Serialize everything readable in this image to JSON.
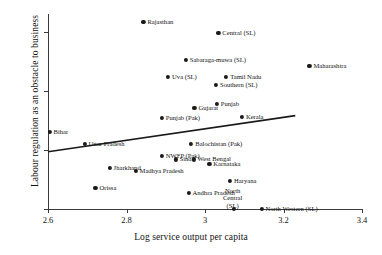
{
  "chart_data": {
    "type": "scatter",
    "title": "",
    "xlabel": "Log service output per capita",
    "ylabel": "Labour regulation as an obstacle to business",
    "xlim": [
      2.6,
      3.4
    ],
    "ylim": [
      0,
      0.33
    ],
    "xticks": [
      2.6,
      2.8,
      3.0,
      3.2,
      3.4
    ],
    "xtick_labels": [
      "2.6",
      "2.8",
      "3",
      "3.2",
      "3.4"
    ],
    "yticks": [
      0,
      0.1,
      0.2,
      0.3
    ],
    "ytick_labels": [
      "0",
      ".1",
      ".2",
      ".3"
    ],
    "grid": false,
    "legend": "none",
    "marker_color": "#1a1a1a",
    "line_color": "#1a1a1a",
    "fit_line": {
      "label": "linear fit",
      "x0": 2.6,
      "y0": 0.097,
      "x1": 3.23,
      "y1": 0.158
    },
    "points": [
      {
        "label": "Rajasthan",
        "x": 2.843,
        "y": 0.316,
        "lpos": "r"
      },
      {
        "label": "Central (SL)",
        "x": 3.034,
        "y": 0.298,
        "lpos": "r"
      },
      {
        "label": "Sabaraga-muwa (SL)",
        "x": 2.951,
        "y": 0.253,
        "lpos": "r"
      },
      {
        "label": "Maharashtra",
        "x": 3.266,
        "y": 0.242,
        "lpos": "r"
      },
      {
        "label": "Tamil Nadu",
        "x": 3.054,
        "y": 0.223,
        "lpos": "r"
      },
      {
        "label": "Uva (SL)",
        "x": 2.906,
        "y": 0.223,
        "lpos": "r"
      },
      {
        "label": "Southern (SL)",
        "x": 3.028,
        "y": 0.21,
        "lpos": "r"
      },
      {
        "label": "Punjab",
        "x": 3.03,
        "y": 0.178,
        "lpos": "r"
      },
      {
        "label": "Gujarat",
        "x": 2.973,
        "y": 0.171,
        "lpos": "r"
      },
      {
        "label": "Kerala",
        "x": 3.094,
        "y": 0.156,
        "lpos": "r"
      },
      {
        "label": "Punjab (Pak)",
        "x": 2.89,
        "y": 0.154,
        "lpos": "r"
      },
      {
        "label": "Bihar",
        "x": 2.604,
        "y": 0.131,
        "lpos": "r"
      },
      {
        "label": "Balochistan (Pak)",
        "x": 2.965,
        "y": 0.11,
        "lpos": "r"
      },
      {
        "label": "Uttar Pradesh",
        "x": 2.693,
        "y": 0.11,
        "lpos": "r"
      },
      {
        "label": "NWFP (Pak)",
        "x": 2.89,
        "y": 0.09,
        "lpos": "r"
      },
      {
        "label": "Sind",
        "x": 2.925,
        "y": 0.084,
        "lpos": "r"
      },
      {
        "label": "West Bengal",
        "x": 2.971,
        "y": 0.084,
        "lpos": "r"
      },
      {
        "label": "Karnataka",
        "x": 3.011,
        "y": 0.077,
        "lpos": "r"
      },
      {
        "label": "Jharkhand",
        "x": 2.757,
        "y": 0.07,
        "lpos": "r"
      },
      {
        "label": "Madhya Pradesh",
        "x": 2.823,
        "y": 0.065,
        "lpos": "r"
      },
      {
        "label": "Haryana",
        "x": 3.064,
        "y": 0.048,
        "lpos": "r"
      },
      {
        "label": "Andhra Pradesh",
        "x": 2.958,
        "y": 0.027,
        "lpos": "r"
      },
      {
        "label": "Orissa",
        "x": 2.721,
        "y": 0.036,
        "lpos": "r"
      },
      {
        "label": "North\nCentral\n(SL)",
        "x": 3.073,
        "y": 0.0,
        "lpos": "r"
      },
      {
        "label": "North Western (SL)",
        "x": 3.144,
        "y": 0.0,
        "lpos": "r"
      }
    ]
  }
}
